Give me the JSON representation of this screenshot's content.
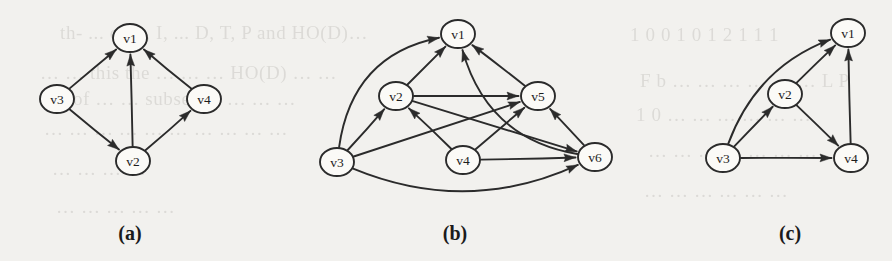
{
  "figure": {
    "background_color": "#f2f1ee",
    "ink_color": "#2b2b2b",
    "node_fill": "#fbfaf7",
    "width": 892,
    "height": 261
  },
  "bleed_text": [
    {
      "text": "th- ... of B, I, ... D, T, P and HO(D)…",
      "x": 60,
      "y": 22
    },
    {
      "text": "1 0 0   1  0   1   2  1   1   1",
      "x": 630,
      "y": 24
    },
    {
      "text": "… … this the … … … HO(D) … …",
      "x": 40,
      "y": 62
    },
    {
      "text": "F  b … … … … … … L  P",
      "x": 640,
      "y": 70
    },
    {
      "text": "… of   … … subset … … … …",
      "x": 48,
      "y": 88
    },
    {
      "text": "1  0  …  …  …  …  …  …",
      "x": 636,
      "y": 104
    },
    {
      "text": "… … … … … … … … … …",
      "x": 44,
      "y": 118
    },
    {
      "text": "… … … … … … …",
      "x": 648,
      "y": 140
    },
    {
      "text": "…  …  …  …",
      "x": 52,
      "y": 158
    },
    {
      "text": "… … … … … …",
      "x": 644,
      "y": 180
    },
    {
      "text": "… … … … …",
      "x": 56,
      "y": 196
    }
  ],
  "graphs": [
    {
      "id": "graph-a",
      "caption": "(a)",
      "caption_x": 130,
      "caption_y": 233,
      "nodes": [
        {
          "id": "v1",
          "label": "v1",
          "cx": 130,
          "cy": 38,
          "rx": 17,
          "ry": 14
        },
        {
          "id": "v3",
          "label": "v3",
          "cx": 57,
          "cy": 99,
          "rx": 17,
          "ry": 14
        },
        {
          "id": "v4",
          "label": "v4",
          "cx": 204,
          "cy": 99,
          "rx": 17,
          "ry": 14
        },
        {
          "id": "v2",
          "label": "v2",
          "cx": 133,
          "cy": 161,
          "rx": 17,
          "ry": 14
        }
      ],
      "edges": [
        {
          "from": "v3",
          "to": "v1",
          "curve": 0
        },
        {
          "from": "v3",
          "to": "v2",
          "curve": 0
        },
        {
          "from": "v2",
          "to": "v1",
          "curve": 0
        },
        {
          "from": "v2",
          "to": "v4",
          "curve": 0
        },
        {
          "from": "v4",
          "to": "v1",
          "curve": 0
        }
      ]
    },
    {
      "id": "graph-b",
      "caption": "(b)",
      "caption_x": 455,
      "caption_y": 233,
      "nodes": [
        {
          "id": "v1",
          "label": "v1",
          "cx": 458,
          "cy": 34,
          "rx": 17,
          "ry": 14
        },
        {
          "id": "v2",
          "label": "v2",
          "cx": 396,
          "cy": 96,
          "rx": 17,
          "ry": 14
        },
        {
          "id": "v5",
          "label": "v5",
          "cx": 538,
          "cy": 96,
          "rx": 17,
          "ry": 14
        },
        {
          "id": "v3",
          "label": "v3",
          "cx": 337,
          "cy": 162,
          "rx": 17,
          "ry": 14
        },
        {
          "id": "v4",
          "label": "v4",
          "cx": 463,
          "cy": 160,
          "rx": 17,
          "ry": 14
        },
        {
          "id": "v6",
          "label": "v6",
          "cx": 595,
          "cy": 157,
          "rx": 17,
          "ry": 14
        }
      ],
      "edges": [
        {
          "from": "v3",
          "to": "v1",
          "curve": -62
        },
        {
          "from": "v2",
          "to": "v1",
          "curve": 0
        },
        {
          "from": "v5",
          "to": "v1",
          "curve": 0
        },
        {
          "from": "v6",
          "to": "v1",
          "curve": -58
        },
        {
          "from": "v3",
          "to": "v2",
          "curve": 0
        },
        {
          "from": "v4",
          "to": "v2",
          "curve": 0
        },
        {
          "from": "v2",
          "to": "v5",
          "curve": 0
        },
        {
          "from": "v3",
          "to": "v5",
          "curve": 0
        },
        {
          "from": "v4",
          "to": "v5",
          "curve": 0
        },
        {
          "from": "v6",
          "to": "v5",
          "curve": 0
        },
        {
          "from": "v2",
          "to": "v6",
          "curve": 0
        },
        {
          "from": "v4",
          "to": "v6",
          "curve": 0
        },
        {
          "from": "v3",
          "to": "v6",
          "curve": 56
        }
      ]
    },
    {
      "id": "graph-c",
      "caption": "(c)",
      "caption_x": 790,
      "caption_y": 233,
      "nodes": [
        {
          "id": "v1",
          "label": "v1",
          "cx": 848,
          "cy": 33,
          "rx": 17,
          "ry": 14
        },
        {
          "id": "v2",
          "label": "v2",
          "cx": 785,
          "cy": 94,
          "rx": 17,
          "ry": 14
        },
        {
          "id": "v3",
          "label": "v3",
          "cx": 723,
          "cy": 158,
          "rx": 17,
          "ry": 14
        },
        {
          "id": "v4",
          "label": "v4",
          "cx": 851,
          "cy": 158,
          "rx": 17,
          "ry": 14
        }
      ],
      "edges": [
        {
          "from": "v3",
          "to": "v1",
          "curve": -40
        },
        {
          "from": "v3",
          "to": "v2",
          "curve": 0
        },
        {
          "from": "v2",
          "to": "v1",
          "curve": 0
        },
        {
          "from": "v3",
          "to": "v4",
          "curve": 0
        },
        {
          "from": "v2",
          "to": "v4",
          "curve": 0
        },
        {
          "from": "v4",
          "to": "v1",
          "curve": 0
        }
      ]
    }
  ]
}
